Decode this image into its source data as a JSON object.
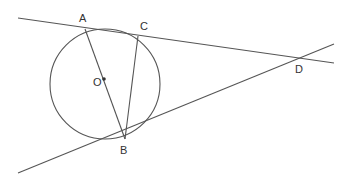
{
  "diagram": {
    "type": "geometry",
    "stroke_color": "#555555",
    "label_color": "#333333",
    "circle": {
      "center": "O",
      "cx": 105,
      "cy": 84,
      "r": 55
    },
    "points": {
      "A": {
        "label": "A",
        "x": 85,
        "y": 29
      },
      "C": {
        "label": "C",
        "x": 138,
        "y": 36
      },
      "O": {
        "label": "O",
        "x": 104,
        "y": 79
      },
      "B": {
        "label": "B",
        "x": 125,
        "y": 139
      },
      "D": {
        "label": "D",
        "x": 298,
        "y": 59
      }
    },
    "segments": [
      {
        "name": "line-ACD",
        "from": [
          18,
          18
        ],
        "to": [
          334,
          63
        ]
      },
      {
        "name": "tangent-BD",
        "from": [
          18,
          173
        ],
        "to": [
          334,
          44
        ]
      },
      {
        "name": "diameter-AB",
        "from": "A",
        "to": "B"
      },
      {
        "name": "chord-CB",
        "from": "C",
        "to": "B"
      }
    ]
  }
}
